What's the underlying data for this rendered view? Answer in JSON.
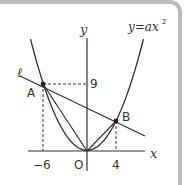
{
  "diagram": {
    "equation_label": "y=ax",
    "equation_exponent": "2",
    "axis_x_label": "x",
    "axis_y_label": "y",
    "origin_label": "O",
    "line_label": "ℓ",
    "points": [
      {
        "label": "A",
        "x": -6,
        "y": 9
      },
      {
        "label": "B",
        "x": 4,
        "y": 4
      }
    ],
    "tick_labels": {
      "x_neg": "−6",
      "x_pos": "4",
      "y_val": "9"
    },
    "colors": {
      "stroke": "#333333",
      "frame": "#b9b9b9"
    }
  }
}
